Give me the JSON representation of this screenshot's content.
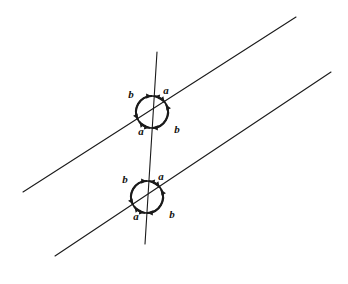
{
  "figure": {
    "background_color": "#ffffff",
    "ink_color": "#1a1a1a",
    "stroke_width_line": 1.1,
    "stroke_width_circle": 1.6,
    "stroke_width_arc": 2.1
  },
  "lines": [
    {
      "id": "parallel-line-upper",
      "label": "upper parallel line",
      "x1": 23,
      "y1": 192,
      "x2": 296,
      "y2": 17
    },
    {
      "id": "parallel-line-lower",
      "label": "lower parallel line",
      "x1": 55,
      "y1": 256,
      "x2": 331,
      "y2": 72
    },
    {
      "id": "transversal-line",
      "label": "transversal",
      "x1": 157,
      "y1": 52,
      "x2": 145,
      "y2": 244
    }
  ],
  "intersections": [
    {
      "id": "intersection-upper",
      "cx": 152,
      "cy": 112,
      "r": 16,
      "labels": [
        {
          "id": "upper-a-top-right",
          "text": "a",
          "x": 166,
          "y": 90
        },
        {
          "id": "upper-b-top-left",
          "text": "b",
          "x": 131,
          "y": 94
        },
        {
          "id": "upper-a-bottom-left",
          "text": "a",
          "x": 141,
          "y": 131
        },
        {
          "id": "upper-b-bottom-right",
          "text": "b",
          "x": 177,
          "y": 129
        }
      ]
    },
    {
      "id": "intersection-lower",
      "cx": 147,
      "cy": 197,
      "r": 16,
      "labels": [
        {
          "id": "lower-a-top-right",
          "text": "a",
          "x": 161,
          "y": 176
        },
        {
          "id": "lower-b-top-left",
          "text": "b",
          "x": 125,
          "y": 179
        },
        {
          "id": "lower-a-bottom-left",
          "text": "a",
          "x": 136,
          "y": 216
        },
        {
          "id": "lower-b-bottom-right",
          "text": "b",
          "x": 172,
          "y": 214
        }
      ]
    }
  ],
  "chart_data": {
    "type": "diagram",
    "angle_labels": [
      "a",
      "b",
      "a",
      "b"
    ]
  }
}
